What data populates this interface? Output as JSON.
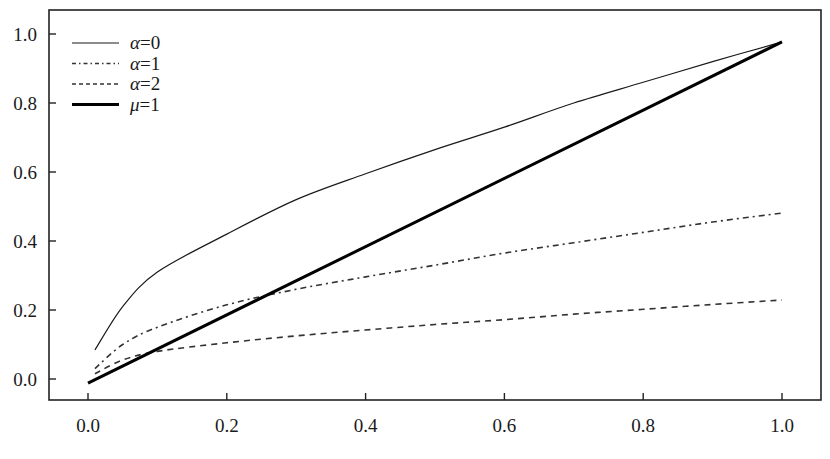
{
  "chart_data": {
    "type": "line",
    "title": "",
    "xlabel": "",
    "ylabel": "",
    "xlim": [
      -0.095,
      1.056
    ],
    "ylim": [
      -0.058,
      1.07
    ],
    "grid": false,
    "legend_position": "upper left",
    "x_ticks": [
      0.0,
      0.2,
      0.4,
      0.6,
      0.8,
      1.0
    ],
    "x_tick_labels": [
      "0.0",
      "0.2",
      "0.4",
      "0.6",
      "0.8",
      "1.0"
    ],
    "y_ticks": [
      0.0,
      0.2,
      0.4,
      0.6,
      0.8,
      1.0
    ],
    "y_tick_labels": [
      "0.0",
      "0.2",
      "0.4",
      "0.6",
      "0.8",
      "1.0"
    ],
    "series": [
      {
        "name": "α=0",
        "symbol": "α",
        "value_label": "=0",
        "style": "solid",
        "stroke_width": 1.2,
        "color": "#1a1a1a",
        "x": [
          0.01,
          0.05,
          0.1,
          0.2,
          0.3,
          0.4,
          0.5,
          0.6,
          0.7,
          0.8,
          0.9,
          1.0
        ],
        "values": [
          0.084,
          0.21,
          0.31,
          0.42,
          0.52,
          0.595,
          0.665,
          0.73,
          0.8,
          0.86,
          0.92,
          0.977
        ]
      },
      {
        "name": "α=1",
        "symbol": "α",
        "value_label": "=1",
        "style": "dashdot",
        "stroke_width": 1.6,
        "color": "#333333",
        "x": [
          0.01,
          0.05,
          0.1,
          0.2,
          0.3,
          0.4,
          0.5,
          0.6,
          0.7,
          0.8,
          0.9,
          1.0
        ],
        "values": [
          0.03,
          0.1,
          0.15,
          0.215,
          0.26,
          0.296,
          0.33,
          0.365,
          0.395,
          0.425,
          0.455,
          0.481
        ]
      },
      {
        "name": "α=2",
        "symbol": "α",
        "value_label": "=2",
        "style": "dashed",
        "stroke_width": 1.6,
        "color": "#333333",
        "x": [
          0.01,
          0.05,
          0.1,
          0.2,
          0.3,
          0.4,
          0.5,
          0.6,
          0.7,
          0.8,
          0.9,
          1.0
        ],
        "values": [
          0.015,
          0.055,
          0.08,
          0.105,
          0.125,
          0.142,
          0.158,
          0.172,
          0.188,
          0.202,
          0.216,
          0.229
        ]
      },
      {
        "name": "μ=1",
        "symbol": "μ",
        "value_label": "=1",
        "style": "solid-thick",
        "stroke_width": 3,
        "color": "#000000",
        "x": [
          0.0,
          1.0
        ],
        "values": [
          -0.012,
          0.977
        ]
      }
    ]
  },
  "layout": {
    "plot_left": 49,
    "plot_top": 10,
    "plot_right": 821,
    "plot_bottom": 400,
    "x0_px": 88,
    "x_scale_px": 694,
    "y0_px": 379,
    "y_scale_px": 345,
    "frame_color": "#222222",
    "background": "#ffffff"
  }
}
